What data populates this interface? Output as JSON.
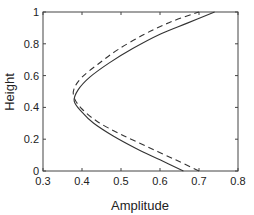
{
  "chart_data": {
    "type": "line",
    "title": "",
    "xlabel": "Amplitude",
    "ylabel": "Height",
    "xlim": [
      0.3,
      0.8
    ],
    "ylim": [
      0,
      1
    ],
    "xticks": [
      0.3,
      0.4,
      0.5,
      0.6,
      0.7,
      0.8
    ],
    "xtick_labels": [
      "0.3",
      "0.4",
      "0.5",
      "0.6",
      "0.7",
      "0.8"
    ],
    "yticks": [
      0,
      0.2,
      0.4,
      0.6,
      0.8,
      1
    ],
    "ytick_labels": [
      "0",
      "0.2",
      "0.4",
      "0.6",
      "0.8",
      "1"
    ],
    "grid": false,
    "legend": null,
    "box": true,
    "series": [
      {
        "name": "solid",
        "style": "solid",
        "color": "#333333",
        "points": [
          [
            0.66,
            0.0
          ],
          [
            0.6,
            0.07
          ],
          [
            0.54,
            0.14
          ],
          [
            0.48,
            0.22
          ],
          [
            0.43,
            0.3
          ],
          [
            0.4,
            0.37
          ],
          [
            0.38,
            0.44
          ],
          [
            0.39,
            0.51
          ],
          [
            0.42,
            0.59
          ],
          [
            0.47,
            0.68
          ],
          [
            0.53,
            0.77
          ],
          [
            0.6,
            0.86
          ],
          [
            0.67,
            0.93
          ],
          [
            0.74,
            1.0
          ]
        ]
      },
      {
        "name": "dashed",
        "style": "dashed",
        "color": "#333333",
        "points": [
          [
            0.7,
            0.0
          ],
          [
            0.64,
            0.07
          ],
          [
            0.57,
            0.15
          ],
          [
            0.5,
            0.23
          ],
          [
            0.44,
            0.31
          ],
          [
            0.4,
            0.39
          ],
          [
            0.38,
            0.46
          ],
          [
            0.38,
            0.52
          ],
          [
            0.4,
            0.59
          ],
          [
            0.44,
            0.67
          ],
          [
            0.49,
            0.76
          ],
          [
            0.56,
            0.86
          ],
          [
            0.63,
            0.94
          ],
          [
            0.7,
            1.0
          ]
        ]
      }
    ]
  }
}
